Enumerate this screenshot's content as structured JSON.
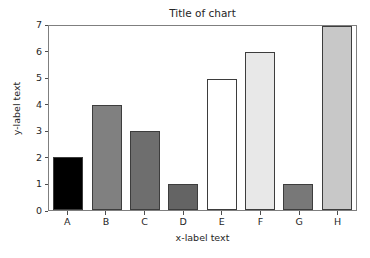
{
  "chart_data": {
    "type": "bar",
    "title": "Title of chart",
    "xlabel": "x-label text",
    "ylabel": "y-label text",
    "categories": [
      "A",
      "B",
      "C",
      "D",
      "E",
      "F",
      "G",
      "H"
    ],
    "values": [
      2,
      4,
      3,
      1,
      5,
      6,
      1,
      7
    ],
    "bar_colors": [
      "#000000",
      "#808080",
      "#6e6e6e",
      "#646464",
      "#ffffff",
      "#e8e8e8",
      "#787878",
      "#c8c8c8"
    ],
    "bar_edge_color": "#3d3d3d",
    "ylim": [
      0,
      7
    ],
    "yticks": [
      0,
      1,
      2,
      3,
      4,
      5,
      6,
      7
    ],
    "ytick_labels": [
      "0",
      "1",
      "2",
      "3",
      "4",
      "5",
      "6",
      "7"
    ],
    "grid": false,
    "legend": "none",
    "axes_frame_color": "#7f7f7f",
    "background_color": "#ffffff"
  }
}
